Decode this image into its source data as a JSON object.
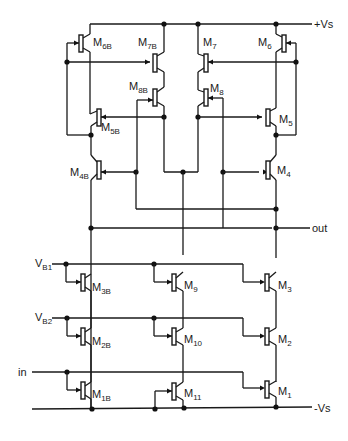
{
  "diagram": {
    "rails": {
      "positive": "+Vs",
      "negative": "-Vs"
    },
    "ports": {
      "output": "out",
      "input": "in",
      "bias1": {
        "main": "V",
        "sub": "B1"
      },
      "bias2": {
        "main": "V",
        "sub": "B2"
      }
    },
    "transistors": [
      {
        "id": "M6B",
        "main": "M",
        "sub": "6B"
      },
      {
        "id": "M7B",
        "main": "M",
        "sub": "7B"
      },
      {
        "id": "M7",
        "main": "M",
        "sub": "7"
      },
      {
        "id": "M6",
        "main": "M",
        "sub": "6"
      },
      {
        "id": "M8B",
        "main": "M",
        "sub": "8B"
      },
      {
        "id": "M8",
        "main": "M",
        "sub": "8"
      },
      {
        "id": "M5B",
        "main": "M",
        "sub": "5B"
      },
      {
        "id": "M5",
        "main": "M",
        "sub": "5"
      },
      {
        "id": "M4B",
        "main": "M",
        "sub": "4B"
      },
      {
        "id": "M4",
        "main": "M",
        "sub": "4"
      },
      {
        "id": "M3B",
        "main": "M",
        "sub": "3B"
      },
      {
        "id": "M9",
        "main": "M",
        "sub": "9"
      },
      {
        "id": "M3",
        "main": "M",
        "sub": "3"
      },
      {
        "id": "M2B",
        "main": "M",
        "sub": "2B"
      },
      {
        "id": "M10",
        "main": "M",
        "sub": "10"
      },
      {
        "id": "M2",
        "main": "M",
        "sub": "2"
      },
      {
        "id": "M1B",
        "main": "M",
        "sub": "1B"
      },
      {
        "id": "M11",
        "main": "M",
        "sub": "11"
      },
      {
        "id": "M1",
        "main": "M",
        "sub": "1"
      }
    ]
  }
}
